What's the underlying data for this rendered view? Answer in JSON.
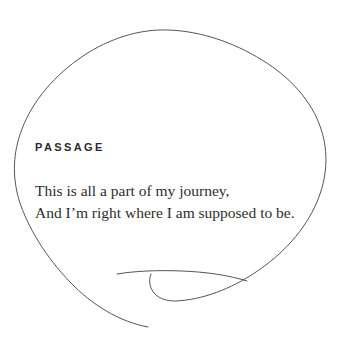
{
  "canvas": {
    "width": 345,
    "height": 351,
    "background_color": "#ffffff"
  },
  "artwork": {
    "name": "hand-drawn-blob-outline",
    "description": "hand drawn irregular circular speech bubble outline with a tail stroke at lower left",
    "stroke_color": "#555555",
    "stroke_width": 1
  },
  "passage": {
    "eyebrow": "PASSAGE",
    "eyebrow_color": "#2b2b2b",
    "text_color": "#2e2e2e",
    "lines": [
      "This is all a part of my journey,",
      "And I’m right where I am supposed to be."
    ]
  }
}
